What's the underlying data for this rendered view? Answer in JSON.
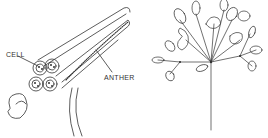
{
  "figure": {
    "left_panel": {
      "subject": "anther cross-section",
      "labels": {
        "cell": "CELL",
        "anther": "ANTHER"
      }
    },
    "right_panel": {
      "subject": "umbel flower cluster"
    },
    "colors": {
      "ink": "#333333",
      "background": "#ffffff"
    }
  }
}
